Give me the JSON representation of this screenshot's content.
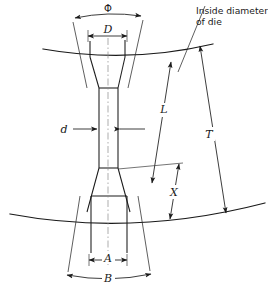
{
  "figure": {
    "type": "engineering-dimension-diagram",
    "background_color": "#ffffff",
    "line_color": "#1a1a1a",
    "centerline_color": "#8a8a8a"
  },
  "annotations": {
    "note_die": {
      "line1": "Inside diameter",
      "line2": "of die"
    }
  },
  "dimensions": [
    {
      "key": "phi",
      "label": "Φ",
      "style": "upright",
      "orientation": "horizontal-arc",
      "location": "top-overall-flare"
    },
    {
      "key": "D",
      "label": "D",
      "style": "italic",
      "orientation": "horizontal",
      "location": "top-inner-width"
    },
    {
      "key": "d",
      "label": "d",
      "style": "italic",
      "orientation": "horizontal",
      "location": "gauge-width"
    },
    {
      "key": "L",
      "label": "L",
      "style": "italic",
      "orientation": "vertical",
      "location": "gauge-length"
    },
    {
      "key": "T",
      "label": "T",
      "style": "italic",
      "orientation": "vertical",
      "location": "overall-die-thickness"
    },
    {
      "key": "X",
      "label": "X",
      "style": "italic",
      "orientation": "vertical",
      "location": "lower-taper-length"
    },
    {
      "key": "A",
      "label": "A",
      "style": "italic",
      "orientation": "horizontal",
      "location": "bottom-inner-width"
    },
    {
      "key": "B",
      "label": "B",
      "style": "italic",
      "orientation": "horizontal-arc",
      "location": "bottom-overall-flare"
    }
  ]
}
